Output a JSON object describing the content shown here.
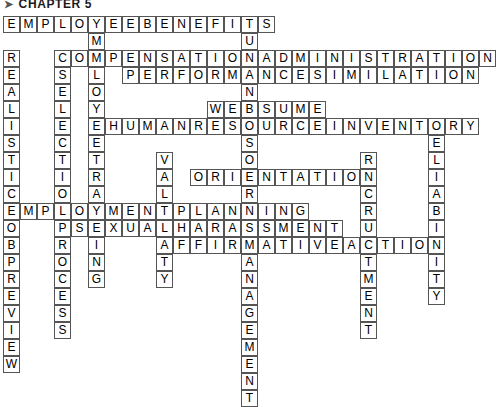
{
  "header": {
    "bullet": "➤",
    "title": "CHAPTER 5"
  },
  "puzzle": {
    "cell_size": 17,
    "origin_x": 3,
    "origin_y": 16,
    "columns": 26,
    "rows": 14,
    "across": [
      {
        "name": "employee-benefits",
        "row": 0,
        "col": 0,
        "text": "EMPLOYEEBENEFITS"
      },
      {
        "name": "compensation-administration",
        "row": 2,
        "col": 3,
        "text": "COMPENSATIONADMINISTRATION"
      },
      {
        "name": "performance-similation",
        "row": 3,
        "col": 7,
        "text": "PERFORMANCESIMILATION"
      },
      {
        "name": "websume",
        "row": 5,
        "col": 12,
        "text": "WEBSUME"
      },
      {
        "name": "human-resource-inventory",
        "row": 6,
        "col": 6,
        "text": "HUMANRESOURCEINVENTORY"
      },
      {
        "name": "orientation",
        "row": 9,
        "col": 11,
        "text": "ORIENTATION"
      },
      {
        "name": "employment-planning",
        "row": 11,
        "col": 0,
        "text": "EMPLOYMENTPLANNING"
      },
      {
        "name": "sexual-harassment",
        "row": 12,
        "col": 4,
        "text": "SEXUALHARASSMENT"
      },
      {
        "name": "affirmative-action",
        "row": 13,
        "col": 9,
        "text": "AFFIRMATIVEACTION"
      }
    ],
    "down": [
      {
        "name": "employee-training",
        "row": 0,
        "col": 5,
        "text": "EMPLOYEETRAINING"
      },
      {
        "name": "human-resource-management",
        "row": 0,
        "col": 14,
        "text": "HUMANRESOURCEMANAGEMENT"
      },
      {
        "name": "realistic-job-preview",
        "row": 2,
        "col": 0,
        "text": "REALISTICJOBPREVIEW"
      },
      {
        "name": "selection-process",
        "row": 3,
        "col": 3,
        "text": "SELECTIONPROCESS"
      },
      {
        "name": "reliability",
        "row": 6,
        "col": 25,
        "text": "RELIABILITY"
      },
      {
        "name": "validity",
        "row": 8,
        "col": 9,
        "text": "VALIDITY"
      },
      {
        "name": "recruitment",
        "row": 8,
        "col": 21,
        "text": "RECRUITMENT"
      }
    ]
  }
}
